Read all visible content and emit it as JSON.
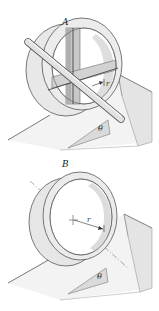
{
  "figures": [
    {
      "id": "A",
      "label": "A",
      "description": "Wheel with cross spokes and axle rod on incline",
      "radius_label": "r",
      "angle_label": "θ"
    },
    {
      "id": "B",
      "label": "B",
      "description": "Thin ring (hoop) on incline",
      "radius_label": "r",
      "angle_label": "θ"
    }
  ],
  "colors": {
    "ring_fill": "#e6e6e6",
    "ring_inner": "#d4d4d4",
    "spoke_dark": "#b8b8b8",
    "incline_top": "#f0f0f0",
    "incline_side": "#e0e0e0",
    "line": "#333333"
  }
}
